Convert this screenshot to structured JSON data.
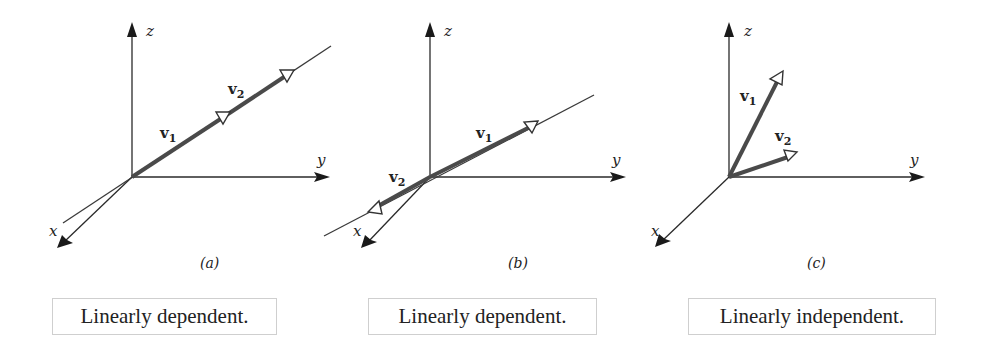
{
  "panels": [
    {
      "id": "a",
      "caption": "(a)",
      "axes": {
        "x": "x",
        "y": "y",
        "z": "z"
      },
      "vectors": [
        {
          "name": "v",
          "sub": "1"
        },
        {
          "name": "v",
          "sub": "2"
        }
      ],
      "status": "Linearly dependent."
    },
    {
      "id": "b",
      "caption": "(b)",
      "axes": {
        "x": "x",
        "y": "y",
        "z": "z"
      },
      "vectors": [
        {
          "name": "v",
          "sub": "1"
        },
        {
          "name": "v",
          "sub": "2"
        }
      ],
      "status": "Linearly dependent."
    },
    {
      "id": "c",
      "caption": "(c)",
      "axes": {
        "x": "x",
        "y": "y",
        "z": "z"
      },
      "vectors": [
        {
          "name": "v",
          "sub": "1"
        },
        {
          "name": "v",
          "sub": "2"
        }
      ],
      "status": "Linearly independent."
    }
  ],
  "colors": {
    "axis": "#2a2a2a",
    "vector": "#4a4a4a",
    "box_border": "#cfcfcf"
  }
}
